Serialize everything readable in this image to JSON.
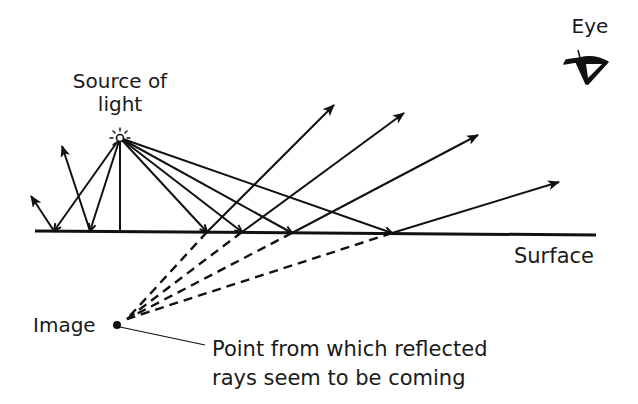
{
  "diagram": {
    "type": "reflection-from-plane-surface",
    "labels": {
      "source_line1": "Source of",
      "source_line2": "light",
      "eye": "Eye",
      "surface": "Surface",
      "image": "Image",
      "note_line1": "Point from which reflected",
      "note_line2": "rays seem to be coming"
    },
    "colors": {
      "ink": "#111111",
      "background": "#ffffff"
    },
    "source": {
      "x": 120,
      "y": 138
    },
    "image_point": {
      "x": 117,
      "y": 325
    },
    "surface": {
      "x1": 35,
      "y1": 231,
      "x2": 596,
      "y2": 235
    },
    "rays": [
      {
        "hit": [
          54,
          231
        ],
        "end": [
          31,
          196
        ],
        "virtual": false
      },
      {
        "hit": [
          90,
          231
        ],
        "end": [
          62,
          146
        ],
        "virtual": false
      },
      {
        "hit": [
          120,
          231
        ],
        "end": null,
        "virtual": false,
        "normal": true
      },
      {
        "hit": [
          207,
          232
        ],
        "end": [
          334,
          105
        ],
        "virtual": true
      },
      {
        "hit": [
          242,
          232
        ],
        "end": [
          404,
          113
        ],
        "virtual": true
      },
      {
        "hit": [
          292,
          233
        ],
        "end": [
          478,
          135
        ],
        "virtual": true
      },
      {
        "hit": [
          392,
          233
        ],
        "end": [
          559,
          182
        ],
        "virtual": true
      }
    ]
  }
}
